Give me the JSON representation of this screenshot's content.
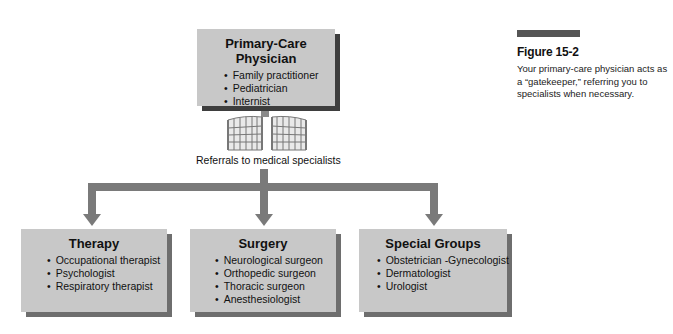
{
  "primary": {
    "title": "Primary-Care Physician",
    "items": [
      "Family practitioner",
      "Pediatrician",
      "Internist"
    ]
  },
  "gate_icon": "gate-icon",
  "referral_label": "Referrals to medical specialists",
  "specialties": [
    {
      "title": "Therapy",
      "items": [
        "Occupational therapist",
        "Psychologist",
        "Respiratory therapist"
      ]
    },
    {
      "title": "Surgery",
      "items": [
        "Neurological surgeon",
        "Orthopedic surgeon",
        "Thoracic surgeon",
        "Anesthesiologist"
      ]
    },
    {
      "title": "Special Groups",
      "items": [
        "Obstetrician -Gynecologist",
        "Dermatologist",
        "Urologist"
      ]
    }
  ],
  "figure": {
    "title": "Figure 15-2",
    "caption": "Your primary-care physician acts as a “gatekeeper,” referring you to specialists when necessary."
  },
  "colors": {
    "box_fill": "#c8c8c8",
    "box_shadow": "#6e6e6e",
    "primary_shadow": "#3e3e3e",
    "connector": "#7a7a7a",
    "figure_bar": "#555555"
  }
}
